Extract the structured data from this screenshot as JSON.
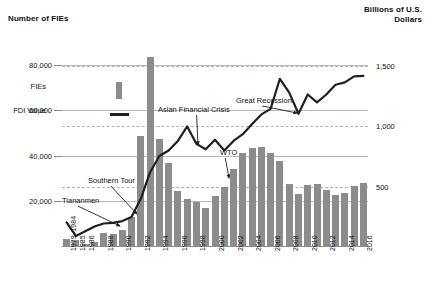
{
  "chart_data": {
    "type": "bar",
    "title": "",
    "ylabel": "Number of FIEs",
    "ylabel_right": "Billions of U.S. Dollars",
    "xlabel": "",
    "ylim": [
      0,
      90000
    ],
    "ylim_right": [
      0,
      1700
    ],
    "grid": true,
    "legend_position": "upper-left-inside",
    "categories": [
      "1979–1984",
      "1985",
      "1986",
      "1987",
      "1988",
      "1989",
      "1990",
      "1991",
      "1992",
      "1993",
      "1994",
      "1995",
      "1996",
      "1997",
      "1998",
      "1999",
      "2000",
      "2001",
      "2002",
      "2003",
      "2004",
      "2005",
      "2006",
      "2007",
      "2008",
      "2009",
      "2010",
      "2011",
      "2012",
      "2013",
      "2014",
      "2015",
      "2016"
    ],
    "tick_labels_x": [
      "1979–1984",
      "1985",
      "1986",
      "",
      "1988",
      "",
      "1990",
      "",
      "1992",
      "",
      "1994",
      "",
      "1996",
      "",
      "1998",
      "",
      "2000",
      "",
      "2002",
      "",
      "2004",
      "",
      "2006",
      "",
      "2008",
      "",
      "2010",
      "",
      "2012",
      "",
      "2014",
      "",
      "2016"
    ],
    "tick_labels_y_left": [
      "20,000",
      "40,000",
      "60,000",
      "80,000"
    ],
    "tick_values_y_left": [
      20000,
      40000,
      60000,
      80000
    ],
    "tick_labels_y_right": [
      "500",
      "1,000",
      "1,500"
    ],
    "tick_values_y_right": [
      500,
      1000,
      1500
    ],
    "series": [
      {
        "name": "FIEs",
        "type": "bar",
        "axis": "left",
        "color": "#8c8c8c",
        "values": [
          3724,
          3073,
          1498,
          2233,
          5945,
          5779,
          7273,
          12978,
          48764,
          83437,
          47549,
          37011,
          24556,
          21001,
          19799,
          16918,
          22347,
          26140,
          34171,
          41081,
          43664,
          44001,
          41473,
          37871,
          27514,
          23435,
          27406,
          27712,
          24925,
          22773,
          23778,
          26575,
          27900
        ]
      },
      {
        "name": "FDI Value",
        "type": "line",
        "axis": "right",
        "color": "#1f1f1f",
        "values": [
          204,
          90,
          130,
          170,
          195,
          200,
          215,
          250,
          400,
          620,
          755,
          800,
          880,
          1000,
          855,
          810,
          890,
          800,
          880,
          935,
          1020,
          1100,
          1145,
          1395,
          1280,
          1105,
          1265,
          1200,
          1265,
          1345,
          1365,
          1415,
          1420
        ]
      }
    ],
    "annotations": [
      {
        "text": "Tiananmen",
        "x": 62,
        "y": 196,
        "arrow_to_x": 120,
        "arrow_to_y": 226
      },
      {
        "text": "Southern Tour",
        "x": 88,
        "y": 176,
        "arrow_to_x": 137,
        "arrow_to_y": 214
      },
      {
        "text": "Asian Financial Crisis",
        "x": 158,
        "y": 105,
        "arrow_to_x": 198,
        "arrow_to_y": 145
      },
      {
        "text": "WTO",
        "x": 220,
        "y": 148,
        "arrow_to_x": 229,
        "arrow_to_y": 178
      },
      {
        "text": "Great Recession",
        "x": 236,
        "y": 96,
        "arrow_to_x": 297,
        "arrow_to_y": 113
      }
    ],
    "legend_entries": [
      {
        "label": "FIEs",
        "marker": "bar"
      },
      {
        "label": "FDI Value",
        "marker": "line"
      }
    ]
  },
  "colors": {
    "bar": "#8c8c8c",
    "line": "#1f1f1f",
    "gridline": "#b9b9b9",
    "gridline_dashed": "#c9a9a2",
    "background": "#ffffff"
  }
}
